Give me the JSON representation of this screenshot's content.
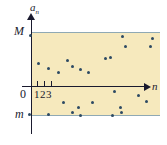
{
  "figure": {
    "axis_vertical_label": "a",
    "axis_vertical_subscript": "n",
    "axis_horizontal_label": "n",
    "upper_bound_label": "M",
    "lower_bound_label": "m",
    "origin_label": "0",
    "tick_labels": "123",
    "ticks": [
      "1",
      "2",
      "3"
    ],
    "colors": {
      "band": "#f6e9bd",
      "bound_line": "#8fa9b4",
      "axis": "#1a1a2e",
      "point": "#2d4a63",
      "background": "#ffffff"
    }
  },
  "chart_data": {
    "type": "scatter",
    "title": "",
    "xlabel": "n",
    "ylabel": "a_n",
    "grid": false,
    "legend": null,
    "annotations": [
      {
        "text": "M",
        "role": "upper-bound",
        "y": 1.0
      },
      {
        "text": "m",
        "role": "lower-bound",
        "y": -1.0
      },
      {
        "text": "0",
        "role": "origin"
      }
    ],
    "ylim": [
      -1.0,
      1.0
    ],
    "xlim": [
      0,
      32
    ],
    "xtick_labels": [
      "1",
      "2",
      "3"
    ],
    "points": [
      {
        "x": 30,
        "y": 35
      },
      {
        "x": 122,
        "y": 36
      },
      {
        "x": 152,
        "y": 38
      },
      {
        "x": 125,
        "y": 46
      },
      {
        "x": 150,
        "y": 46
      },
      {
        "x": 105,
        "y": 58
      },
      {
        "x": 67,
        "y": 60
      },
      {
        "x": 38,
        "y": 63
      },
      {
        "x": 110,
        "y": 57
      },
      {
        "x": 72,
        "y": 66
      },
      {
        "x": 48,
        "y": 68
      },
      {
        "x": 58,
        "y": 72
      },
      {
        "x": 80,
        "y": 69
      },
      {
        "x": 88,
        "y": 72
      },
      {
        "x": 114,
        "y": 91
      },
      {
        "x": 138,
        "y": 95
      },
      {
        "x": 63,
        "y": 102
      },
      {
        "x": 92,
        "y": 102
      },
      {
        "x": 146,
        "y": 101
      },
      {
        "x": 78,
        "y": 107
      },
      {
        "x": 120,
        "y": 107
      },
      {
        "x": 29,
        "y": 114
      },
      {
        "x": 48,
        "y": 114
      },
      {
        "x": 72,
        "y": 112
      },
      {
        "x": 80,
        "y": 115
      },
      {
        "x": 112,
        "y": 115
      },
      {
        "x": 121,
        "y": 112
      }
    ]
  }
}
